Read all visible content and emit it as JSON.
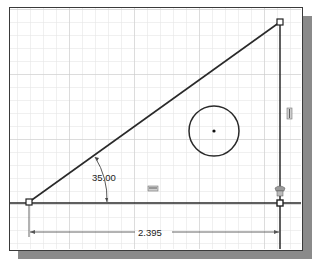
{
  "canvas": {
    "background": "#ffffff",
    "grid_color": "#dcdcdc",
    "grid_major_color": "#c4c4c4",
    "grid_spacing_px": 13,
    "line_color": "#2a2a2a"
  },
  "sketch": {
    "triangle": {
      "vertices": [
        [
          29,
          202
        ],
        [
          280,
          22
        ],
        [
          280,
          202
        ]
      ]
    },
    "circle": {
      "center": [
        214,
        131
      ],
      "radius": 25
    },
    "dimensions": {
      "angle": {
        "value": "35.00",
        "unit": "deg"
      },
      "horizontal_length": {
        "value": "2.395"
      }
    },
    "constraints": [
      {
        "type": "horizontal",
        "icon": "horizontal-constraint-icon"
      },
      {
        "type": "vertical",
        "icon": "vertical-constraint-icon"
      },
      {
        "type": "coincident",
        "icon": "coincident-constraint-icon"
      }
    ]
  }
}
